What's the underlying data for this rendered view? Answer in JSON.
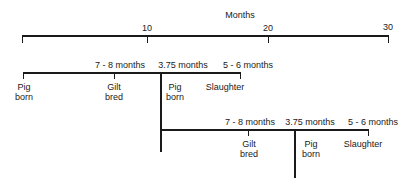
{
  "axis": {
    "title": "Months",
    "ticks": [
      "10",
      "20",
      "30"
    ]
  },
  "cycle1": {
    "intervals": [
      "7 - 8 months",
      "3.75 months",
      "5 - 6 months"
    ],
    "events": [
      {
        "line1": "Pig",
        "line2": "born"
      },
      {
        "line1": "Gilt",
        "line2": "bred"
      },
      {
        "line1": "Pig",
        "line2": "born"
      },
      {
        "line1": "Slaughter",
        "line2": ""
      }
    ]
  },
  "cycle2": {
    "intervals": [
      "7 - 8 months",
      "3.75 months",
      "5 - 6 months"
    ],
    "events": [
      {
        "line1": "Gilt",
        "line2": "bred"
      },
      {
        "line1": "Pig",
        "line2": "born"
      },
      {
        "line1": "Slaughter",
        "line2": ""
      }
    ]
  }
}
